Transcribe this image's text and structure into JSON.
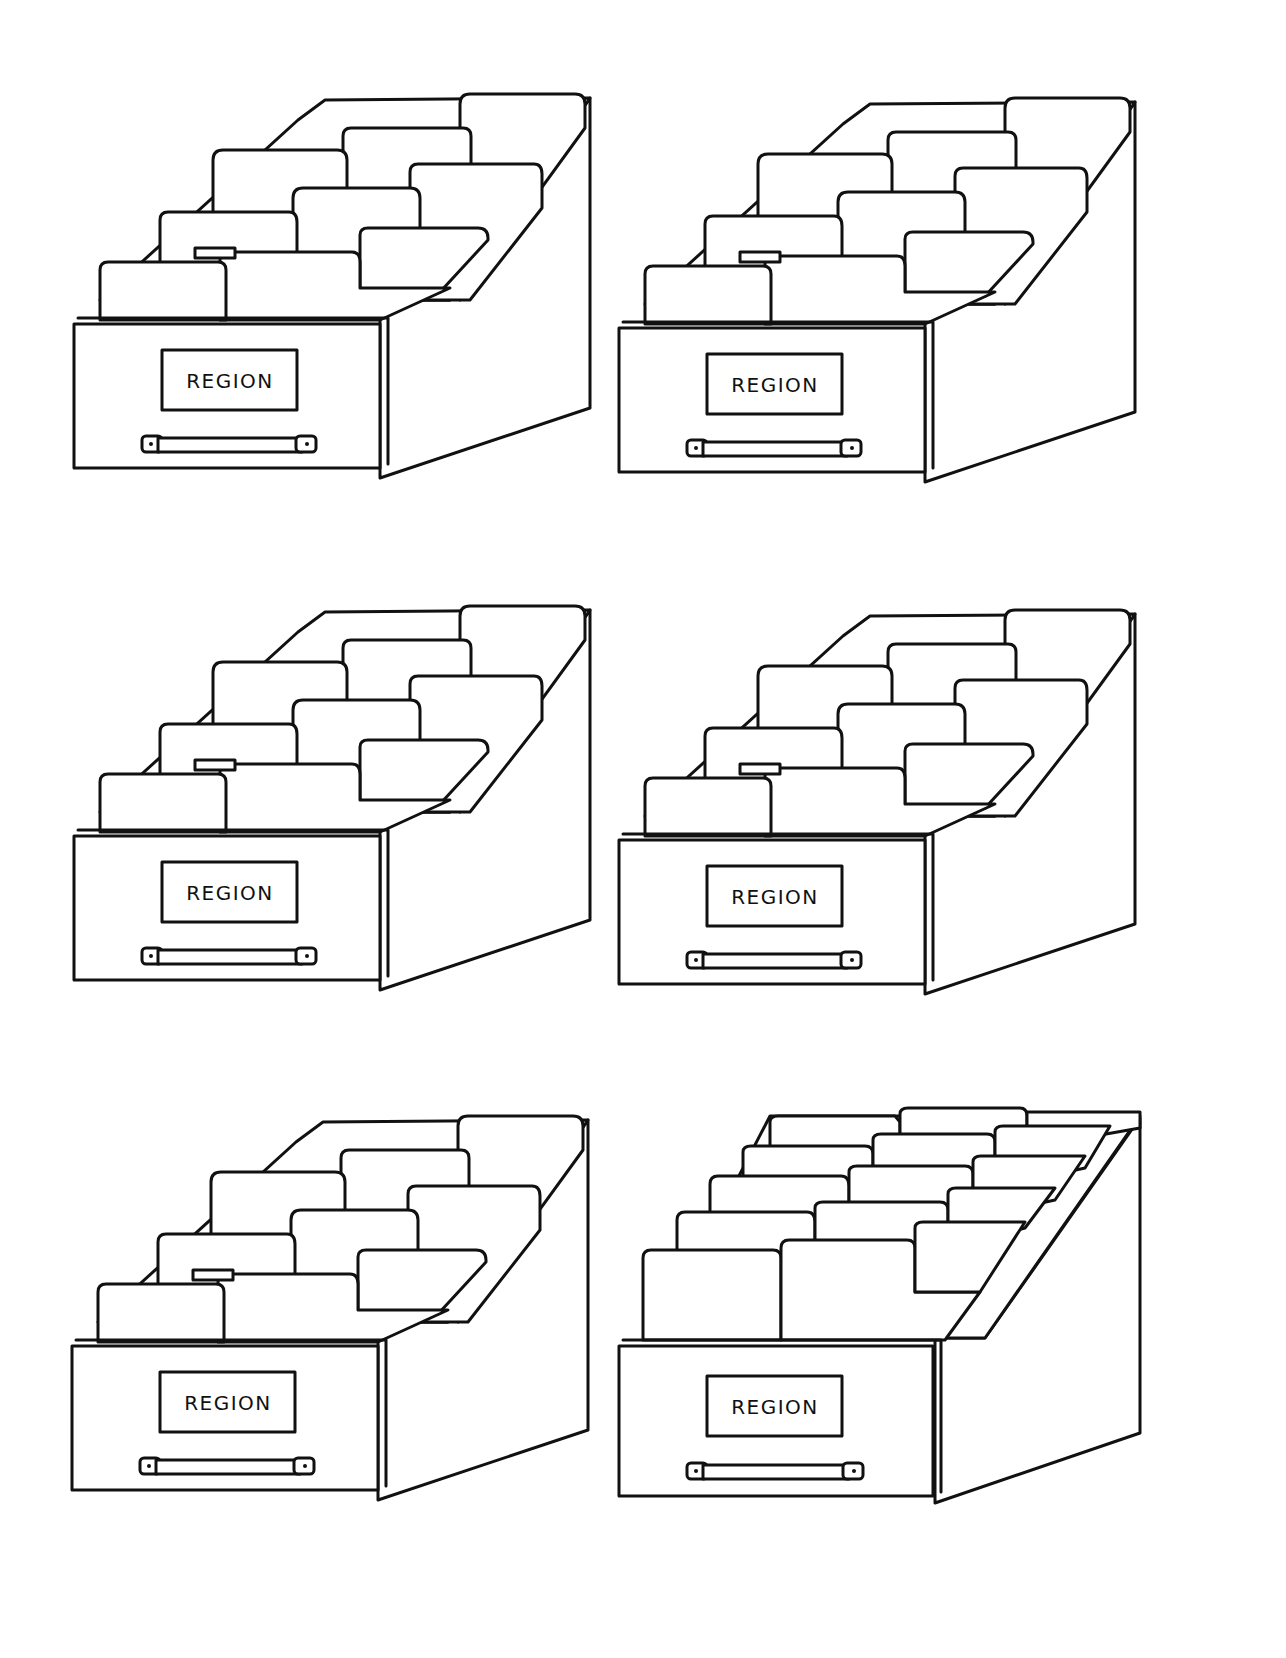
{
  "page": {
    "background": "#ffffff",
    "line_color": "#111111"
  },
  "drawers": [
    {
      "label": "REGION",
      "x": 70,
      "y": 88,
      "tabs": "standard"
    },
    {
      "label": "REGION",
      "x": 615,
      "y": 90,
      "tabs": "standard"
    },
    {
      "label": "REGION",
      "x": 70,
      "y": 600,
      "tabs": "standard"
    },
    {
      "label": "REGION",
      "x": 615,
      "y": 604,
      "tabs": "standard"
    },
    {
      "label": "REGION",
      "x": 68,
      "y": 1110,
      "tabs": "standard"
    },
    {
      "label": "REGION",
      "x": 615,
      "y": 1112,
      "tabs": "dense"
    }
  ]
}
